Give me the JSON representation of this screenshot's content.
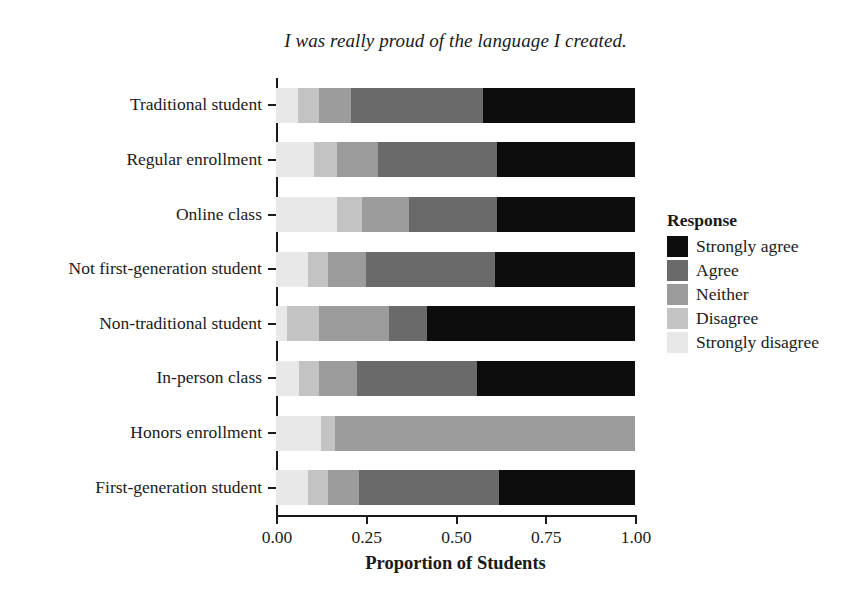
{
  "chart_data": {
    "type": "bar",
    "subtype": "horizontal-stacked-proportion",
    "title": "I was really proud of the language I created.",
    "xlabel": "Proportion of Students",
    "ylabel": "",
    "xlim": [
      0,
      1
    ],
    "xticks": [
      "0.00",
      "0.25",
      "0.50",
      "0.75",
      "1.00"
    ],
    "xtick_values": [
      0,
      0.25,
      0.5,
      0.75,
      1
    ],
    "grid": false,
    "legend_title": "Response",
    "legend_position": "right",
    "categories": [
      "Traditional student",
      "Regular enrollment",
      "Online class",
      "Not first-generation student",
      "Non-traditional student",
      "In-person class",
      "Honors enrollment",
      "First-generation student"
    ],
    "series": [
      {
        "name": "Strongly disagree",
        "color": "#e8e8e8",
        "values": [
          0.06,
          0.105,
          0.17,
          0.09,
          0.03,
          0.065,
          0.125,
          0.09
        ]
      },
      {
        "name": "Disagree",
        "color": "#c3c3c3",
        "values": [
          0.06,
          0.065,
          0.07,
          0.055,
          0.09,
          0.055,
          0.04,
          0.055
        ]
      },
      {
        "name": "Neither",
        "color": "#9b9b9b",
        "values": [
          0.09,
          0.115,
          0.13,
          0.105,
          0.195,
          0.105,
          0.835,
          0.085
        ]
      },
      {
        "name": "Agree",
        "color": "#6a6a6a",
        "values": [
          0.367,
          0.33,
          0.245,
          0.36,
          0.105,
          0.335,
          0.0,
          0.39
        ]
      },
      {
        "name": "Strongly agree",
        "color": "#0d0d0d",
        "values": [
          0.423,
          0.385,
          0.385,
          0.39,
          0.58,
          0.44,
          0.0,
          0.38
        ]
      }
    ],
    "legend_entries": [
      {
        "label": "Strongly agree",
        "color": "#0d0d0d"
      },
      {
        "label": "Agree",
        "color": "#6a6a6a"
      },
      {
        "label": "Neither",
        "color": "#9b9b9b"
      },
      {
        "label": "Disagree",
        "color": "#c3c3c3"
      },
      {
        "label": "Strongly disagree",
        "color": "#e8e8e8"
      }
    ],
    "stack_order_left_to_right": [
      "Strongly disagree",
      "Disagree",
      "Neither",
      "Agree",
      "Strongly agree"
    ]
  }
}
